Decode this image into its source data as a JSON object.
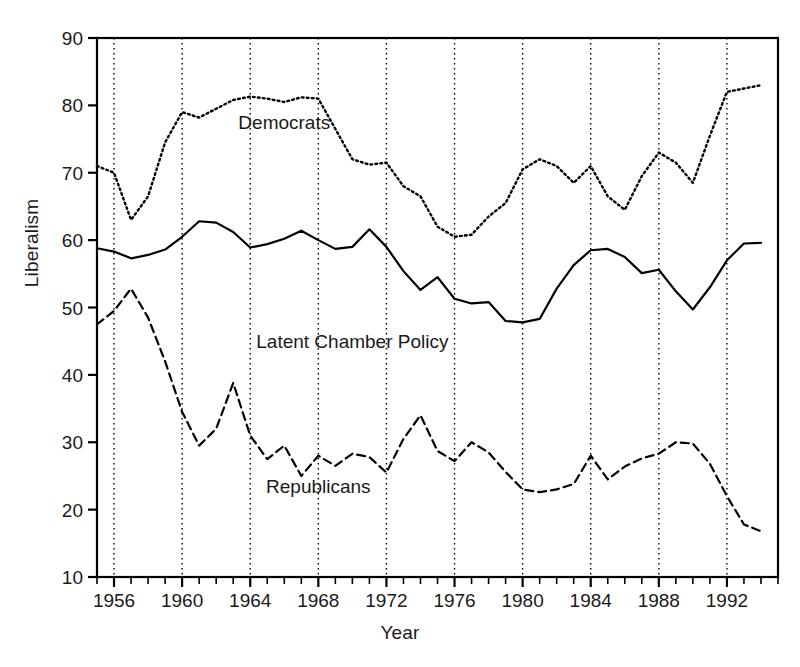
{
  "chart_data": {
    "type": "line",
    "title": "",
    "xlabel": "Year",
    "ylabel": "Liberalism",
    "xlim": [
      1955,
      1995
    ],
    "ylim": [
      10,
      90
    ],
    "ytick_values": [
      10,
      20,
      30,
      40,
      50,
      60,
      70,
      80,
      90
    ],
    "ytick_labels": [
      "10",
      "20",
      "30",
      "40",
      "50",
      "60",
      "70",
      "80",
      "90"
    ],
    "xtick_values": [
      1956,
      1960,
      1964,
      1968,
      1972,
      1976,
      1980,
      1984,
      1988,
      1992
    ],
    "xtick_labels": [
      "1956",
      "1960",
      "1964",
      "1968",
      "1972",
      "1976",
      "1980",
      "1984",
      "1988",
      "1992"
    ],
    "x_minor_tick_step": 1,
    "grid": "vertical dotted gridlines at labeled x ticks",
    "legend_position": "inline annotations on plot",
    "x": [
      1955,
      1956,
      1957,
      1958,
      1959,
      1960,
      1961,
      1962,
      1963,
      1964,
      1965,
      1966,
      1967,
      1968,
      1969,
      1970,
      1971,
      1972,
      1973,
      1974,
      1975,
      1976,
      1977,
      1978,
      1979,
      1980,
      1981,
      1982,
      1983,
      1984,
      1985,
      1986,
      1987,
      1988,
      1989,
      1990,
      1991,
      1992,
      1993,
      1994
    ],
    "series": [
      {
        "name": "Democrats",
        "linestyle": "dotted",
        "color": "#000000",
        "label_x": 1966,
        "label_y": 76.5,
        "values": [
          71.0,
          70.0,
          63.0,
          66.5,
          74.5,
          79.0,
          78.2,
          79.5,
          80.8,
          81.3,
          81.0,
          80.5,
          81.2,
          81.0,
          76.5,
          72.0,
          71.2,
          71.5,
          68.0,
          66.5,
          62.0,
          60.5,
          60.8,
          63.5,
          65.5,
          70.5,
          72.0,
          71.0,
          68.5,
          71.0,
          66.5,
          64.5,
          69.5,
          73.0,
          71.5,
          68.5,
          75.5,
          82.0,
          82.5,
          83.0
        ]
      },
      {
        "name": "Latent Chamber Policy",
        "linestyle": "solid",
        "color": "#000000",
        "label_x": 1970,
        "label_y": 44.0,
        "values": [
          58.8,
          58.3,
          57.3,
          57.8,
          58.6,
          60.5,
          62.8,
          62.6,
          61.2,
          58.9,
          59.4,
          60.2,
          61.4,
          60.0,
          58.7,
          59.0,
          61.6,
          59.0,
          55.4,
          52.6,
          54.5,
          51.3,
          50.6,
          50.8,
          48.0,
          47.8,
          48.3,
          52.8,
          56.3,
          58.5,
          58.7,
          57.5,
          55.1,
          55.6,
          52.4,
          49.7,
          53.0,
          57.0,
          59.5,
          59.6
        ]
      },
      {
        "name": "Republicans",
        "linestyle": "dashed",
        "color": "#000000",
        "label_x": 1968,
        "label_y": 22.5,
        "values": [
          47.5,
          49.5,
          52.8,
          48.5,
          42.0,
          34.5,
          29.5,
          32.0,
          38.8,
          31.0,
          27.5,
          29.5,
          25.0,
          28.0,
          26.5,
          28.3,
          27.8,
          25.5,
          30.5,
          34.0,
          28.7,
          27.2,
          30.0,
          28.5,
          25.6,
          23.0,
          22.6,
          23.0,
          23.8,
          28.0,
          24.5,
          26.4,
          27.6,
          28.3,
          30.0,
          29.8,
          26.8,
          22.0,
          17.8,
          16.8
        ]
      }
    ]
  },
  "labels": {
    "democrats": "Democrats",
    "latent": "Latent Chamber Policy",
    "republicans": "Republicans",
    "ylabel": "Liberalism",
    "xlabel": "Year"
  }
}
